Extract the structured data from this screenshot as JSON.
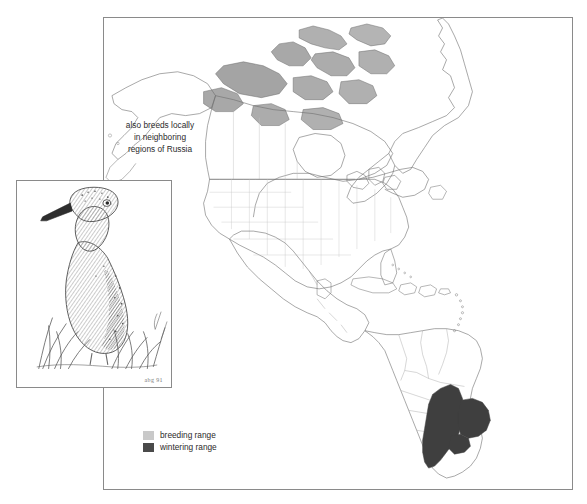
{
  "figure": {
    "type": "range-map"
  },
  "map": {
    "annotation": "also breeds locally\nin neighboring\nregions of Russia",
    "breeding_range_regions": [
      "Canadian Arctic Archipelago",
      "northern Canada"
    ],
    "wintering_range_regions": [
      "northern Argentina",
      "Uruguay",
      "southern Paraguay",
      "southern Brazil"
    ],
    "features": [
      "Alaska",
      "Canada",
      "Greenland",
      "United States with state borders",
      "Mexico",
      "Central America",
      "Caribbean islands",
      "South America with country borders"
    ]
  },
  "legend": {
    "items": [
      {
        "label": "breeding range",
        "color": "#c9c9c9"
      },
      {
        "label": "wintering range",
        "color": "#4a4a4a"
      }
    ]
  },
  "inset": {
    "caption": "shorebird illustration standing in grass",
    "artist_mark": "abg 91"
  },
  "colors": {
    "breeding": "#c9c9c9",
    "wintering": "#4a4a4a",
    "coastline": "#6e6e6e",
    "state_border": "#c4c4c4",
    "frame": "#8a8a8a",
    "background": "#ffffff",
    "text": "#2b2b2b"
  }
}
